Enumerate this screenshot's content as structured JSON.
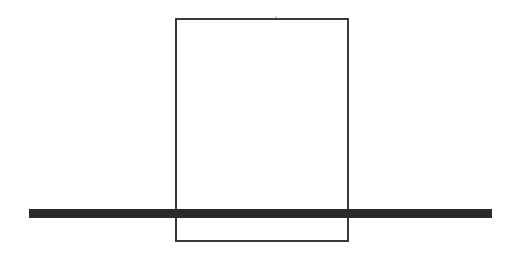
{
  "diagram": {
    "rectangle": {
      "x": 175,
      "y": 18,
      "width": 174,
      "height": 224,
      "stroke": "#3a3a3a",
      "stroke_width": 2
    },
    "bar": {
      "x": 29,
      "y": 209,
      "width": 463,
      "height": 9,
      "fill": "#2a2a2a"
    },
    "artifact_dot": {
      "x": 275,
      "y": 16
    }
  }
}
